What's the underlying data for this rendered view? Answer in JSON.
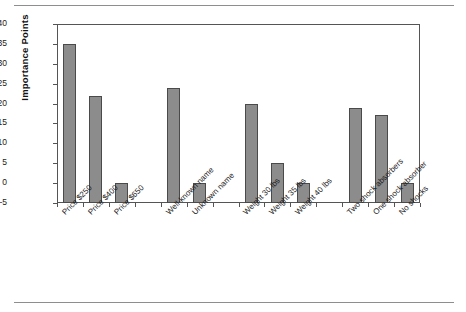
{
  "chart_data": {
    "type": "bar",
    "title": "",
    "xlabel": "",
    "ylabel": "Importance Points",
    "ylim": [
      -5,
      40
    ],
    "yticks": [
      -5,
      0,
      5,
      10,
      15,
      20,
      25,
      30,
      35,
      40
    ],
    "grid": false,
    "legend": "none",
    "bar_color": "#8c8c8c",
    "bar_edge_color": "#4a4a4a",
    "categories": [
      "Price $250",
      "Price $400",
      "Price $650",
      "",
      "Well-known name",
      "Unknown name",
      "",
      "Weight 30 lbs",
      "Weight 35 lbs",
      "Weight 40 lbs",
      "",
      "Two shock absorbers",
      "One shock absorber",
      "No shocks"
    ],
    "values": [
      35,
      22,
      0,
      null,
      24,
      0,
      null,
      20,
      5,
      0,
      null,
      19,
      17,
      0
    ],
    "groups": [
      {
        "name": "Price",
        "categories": [
          "Price $250",
          "Price $400",
          "Price $650"
        ],
        "values": [
          35,
          22,
          0
        ]
      },
      {
        "name": "Brand name",
        "categories": [
          "Well-known name",
          "Unknown name"
        ],
        "values": [
          24,
          0
        ]
      },
      {
        "name": "Weight",
        "categories": [
          "Weight 30 lbs",
          "Weight 35 lbs",
          "Weight 40 lbs"
        ],
        "values": [
          20,
          5,
          0
        ]
      },
      {
        "name": "Shock absorbers",
        "categories": [
          "Two shock absorbers",
          "One shock absorber",
          "No shocks"
        ],
        "values": [
          19,
          17,
          0
        ]
      }
    ]
  },
  "axis": {
    "y_title": "Importance Points",
    "y_tick_labels": [
      "40",
      "35",
      "30",
      "25",
      "20",
      "15",
      "10",
      "5",
      "0",
      "-5"
    ]
  }
}
